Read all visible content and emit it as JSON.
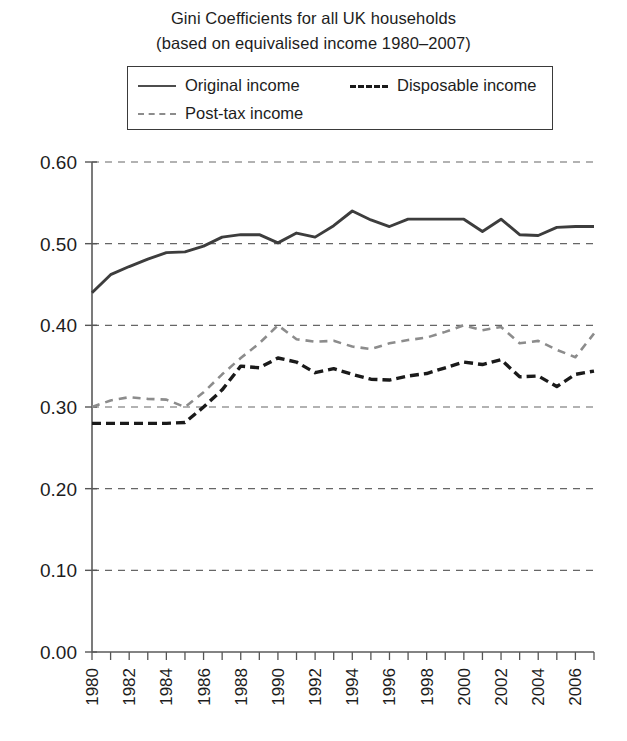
{
  "title": {
    "line1": "Gini Coefficients for all UK households",
    "line2": "(based on equivalised income 1980–2007)"
  },
  "legend": {
    "position": "top-center",
    "entries": [
      {
        "label": "Original income",
        "style": "solid",
        "color": "#4d4d4d",
        "icon": "solid-line-swatch"
      },
      {
        "label": "Disposable income",
        "style": "dashed",
        "color": "#1a1a1a",
        "icon": "dashed-line-swatch"
      },
      {
        "label": "Post-tax income",
        "style": "dashed",
        "color": "#8c8c8c",
        "icon": "dashed-line-swatch"
      }
    ]
  },
  "chart_data": {
    "type": "line",
    "title": "Gini Coefficients for all UK households (based on equivalised income 1980–2007)",
    "xlabel": "",
    "ylabel": "",
    "ylim": [
      0.0,
      0.6
    ],
    "yticks": [
      "0.00",
      "0.10",
      "0.20",
      "0.30",
      "0.40",
      "0.50",
      "0.60"
    ],
    "ytick_values": [
      0.0,
      0.1,
      0.2,
      0.3,
      0.4,
      0.5,
      0.6
    ],
    "grid": "horizontal-dashed",
    "xlim": [
      1980,
      2007
    ],
    "x": [
      1980,
      1981,
      1982,
      1983,
      1984,
      1985,
      1986,
      1987,
      1988,
      1989,
      1990,
      1991,
      1992,
      1993,
      1994,
      1995,
      1996,
      1997,
      1998,
      1999,
      2000,
      2001,
      2002,
      2003,
      2004,
      2005,
      2006,
      2007
    ],
    "xtick_labels": [
      "1980",
      "1982",
      "1984",
      "1986",
      "1988",
      "1990",
      "1992",
      "1994",
      "1996",
      "1998",
      "2000",
      "2002",
      "2004",
      "2006"
    ],
    "xtick_values": [
      1980,
      1982,
      1984,
      1986,
      1988,
      1990,
      1992,
      1994,
      1996,
      1998,
      2000,
      2002,
      2004,
      2006
    ],
    "xtick_rotation": -90,
    "series": [
      {
        "name": "Original income",
        "style": "solid",
        "color": "#3d3d3d",
        "values": [
          0.44,
          0.462,
          0.472,
          0.481,
          0.489,
          0.49,
          0.497,
          0.508,
          0.511,
          0.511,
          0.501,
          0.513,
          0.508,
          0.522,
          0.54,
          0.529,
          0.521,
          0.53,
          0.53,
          0.53,
          0.53,
          0.515,
          0.53,
          0.511,
          0.51,
          0.52,
          0.521,
          0.521
        ]
      },
      {
        "name": "Post-tax income",
        "style": "dashed",
        "color": "#8c8c8c",
        "values": [
          0.3,
          0.308,
          0.312,
          0.31,
          0.309,
          0.3,
          0.318,
          0.34,
          0.36,
          0.378,
          0.4,
          0.383,
          0.38,
          0.381,
          0.374,
          0.371,
          0.378,
          0.382,
          0.385,
          0.392,
          0.4,
          0.394,
          0.398,
          0.378,
          0.381,
          0.37,
          0.361,
          0.39
        ]
      },
      {
        "name": "Disposable income",
        "style": "dashed",
        "color": "#1a1a1a",
        "values": [
          0.28,
          0.28,
          0.28,
          0.28,
          0.28,
          0.281,
          0.3,
          0.321,
          0.35,
          0.348,
          0.36,
          0.355,
          0.342,
          0.347,
          0.34,
          0.334,
          0.333,
          0.338,
          0.341,
          0.348,
          0.355,
          0.352,
          0.358,
          0.337,
          0.338,
          0.325,
          0.34,
          0.344
        ]
      }
    ]
  }
}
